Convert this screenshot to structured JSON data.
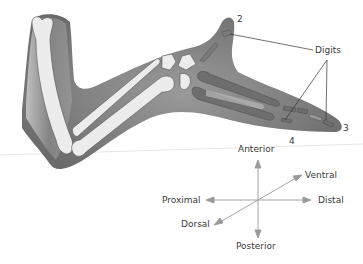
{
  "diagram": {
    "labels": {
      "digits": "Digits",
      "digit_2": "2",
      "digit_3": "3",
      "digit_4": "4"
    },
    "axes": {
      "anterior": "Anterior",
      "posterior": "Posterior",
      "proximal": "Proximal",
      "distal": "Distal",
      "dorsal": "Dorsal",
      "ventral": "Ventral"
    },
    "colors": {
      "limb_fill": "#8a8a8a",
      "limb_shadow": "#5e5e5e",
      "bone_fill": "#ececec",
      "cartilage_fill": "#7a7a7a",
      "arrow": "#9a9a9a",
      "leader_line": "#333333",
      "text": "#3a3a3a"
    }
  }
}
